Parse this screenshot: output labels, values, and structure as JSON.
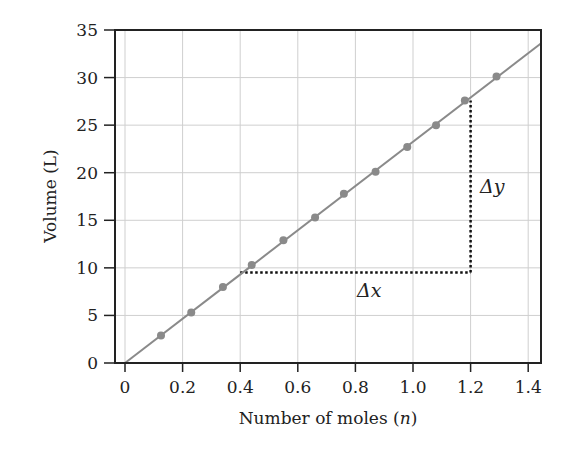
{
  "chart_data": {
    "type": "line",
    "title": "",
    "xlabel": "Number of moles (n)",
    "xlabel_main": "Number of moles (",
    "xlabel_var": "n",
    "xlabel_close": ")",
    "ylabel": "Volume (L)",
    "xlim": [
      -0.03,
      1.445
    ],
    "ylim": [
      0,
      35
    ],
    "grid": true,
    "legend": "none",
    "x_ticks": [
      "0",
      "0.2",
      "0.4",
      "0.6",
      "0.8",
      "1.0",
      "1.2",
      "1.4"
    ],
    "x_tick_values": [
      0,
      0.2,
      0.4,
      0.6,
      0.8,
      1.0,
      1.2,
      1.4
    ],
    "y_ticks": [
      "0",
      "5",
      "10",
      "15",
      "20",
      "25",
      "30",
      "35"
    ],
    "y_tick_values": [
      0,
      5,
      10,
      15,
      20,
      25,
      30,
      35
    ],
    "series": [
      {
        "name": "Volume vs moles",
        "color": "#8a8a8a",
        "x": [
          0.125,
          0.23,
          0.34,
          0.44,
          0.55,
          0.66,
          0.76,
          0.87,
          0.98,
          1.08,
          1.18,
          1.29
        ],
        "y": [
          2.9,
          5.3,
          8.0,
          10.3,
          12.9,
          15.3,
          17.8,
          20.1,
          22.7,
          25.0,
          27.6,
          30.1
        ]
      }
    ],
    "fit_line": {
      "x": [
        0,
        1.445
      ],
      "y": [
        0,
        33.6
      ],
      "color": "#8a8a8a"
    },
    "annotations": [
      {
        "label": "Δx",
        "type": "dotted-horizontal",
        "x_from": 0.4,
        "x_to": 1.2,
        "y": 9.5
      },
      {
        "label": "Δy",
        "type": "dotted-vertical",
        "x": 1.2,
        "y_from": 9.5,
        "y_to": 27.6
      }
    ]
  }
}
